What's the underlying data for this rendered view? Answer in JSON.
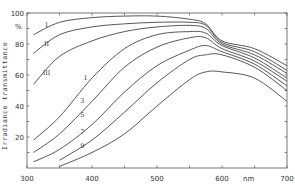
{
  "chart_data": {
    "type": "line",
    "title": "",
    "xlabel": "nm",
    "ylabel": "Irradiance transmittance",
    "y_unit": "%",
    "xlim": [
      300,
      700
    ],
    "ylim": [
      0,
      100
    ],
    "x_ticks": [
      300,
      400,
      500,
      600,
      700
    ],
    "y_ticks": [
      20,
      40,
      60,
      80,
      100
    ],
    "grid": false,
    "legend": "inline curve labels",
    "series": [
      {
        "name": "I",
        "x": [
          310,
          350,
          400,
          450,
          500,
          550,
          575,
          600,
          650,
          700
        ],
        "values": [
          86,
          94,
          97,
          98,
          98,
          96,
          93,
          82,
          77,
          66
        ]
      },
      {
        "name": "II",
        "x": [
          310,
          350,
          400,
          450,
          500,
          550,
          575,
          600,
          650,
          700
        ],
        "values": [
          74,
          86,
          91,
          93,
          94,
          94,
          92,
          81,
          75,
          63
        ]
      },
      {
        "name": "III",
        "x": [
          310,
          350,
          400,
          450,
          500,
          550,
          575,
          600,
          650,
          700
        ],
        "values": [
          54,
          72,
          82,
          88,
          91,
          92,
          90,
          80,
          73,
          61
        ]
      },
      {
        "name": "1",
        "x": [
          310,
          350,
          400,
          450,
          500,
          550,
          575,
          600,
          650,
          700
        ],
        "values": [
          18,
          33,
          58,
          77,
          86,
          88,
          87,
          79,
          71,
          58
        ]
      },
      {
        "name": "3",
        "x": [
          310,
          350,
          400,
          450,
          500,
          550,
          575,
          600,
          650,
          700
        ],
        "values": [
          10,
          22,
          43,
          65,
          78,
          84,
          84,
          77,
          69,
          56
        ]
      },
      {
        "name": "5",
        "x": [
          310,
          350,
          400,
          450,
          500,
          550,
          575,
          600,
          650,
          700
        ],
        "values": [
          4,
          12,
          28,
          49,
          66,
          76,
          79,
          75,
          67,
          53
        ]
      },
      {
        "name": "7",
        "x": [
          350,
          400,
          450,
          500,
          550,
          575,
          600,
          650,
          700
        ],
        "values": [
          5,
          18,
          36,
          55,
          70,
          73,
          73,
          65,
          50
        ]
      },
      {
        "name": "9",
        "x": [
          350,
          400,
          450,
          500,
          550,
          575,
          600,
          650,
          700
        ],
        "values": [
          1,
          10,
          22,
          40,
          57,
          62,
          62,
          58,
          43
        ]
      }
    ],
    "labels": [
      {
        "text": "I",
        "x": 330,
        "y": 91
      },
      {
        "text": "II",
        "x": 330,
        "y": 79
      },
      {
        "text": "III",
        "x": 330,
        "y": 60
      },
      {
        "text": "1",
        "x": 390,
        "y": 57
      },
      {
        "text": "3",
        "x": 385,
        "y": 42
      },
      {
        "text": "5",
        "x": 385,
        "y": 33
      },
      {
        "text": "7",
        "x": 385,
        "y": 22
      },
      {
        "text": "9",
        "x": 385,
        "y": 13
      }
    ]
  },
  "axis_labels": {
    "x_unit": "nm",
    "y_unit": "%",
    "y_title": "Irradiance transmittance"
  }
}
